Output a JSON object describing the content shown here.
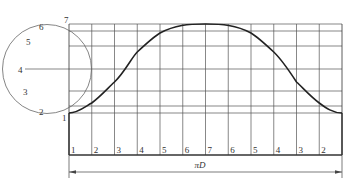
{
  "diagram": {
    "circle_labels": [
      "1",
      "2",
      "3",
      "4",
      "5",
      "6",
      "7"
    ],
    "column_labels": [
      "1",
      "2",
      "3",
      "4",
      "5",
      "6",
      "7",
      "6",
      "5",
      "4",
      "3",
      "2"
    ],
    "dimension_label": "πD",
    "colors": {
      "grid": "#555555",
      "curve": "#222222",
      "circle": "#666666",
      "text": "#333333"
    }
  }
}
